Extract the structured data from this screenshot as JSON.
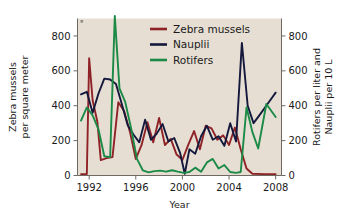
{
  "chart_data": {
    "type": "line",
    "title": "",
    "xlabel": "Year",
    "ylabel": "Zebra mussels per square meter",
    "ylabel_right": "Rotifers per liter and Nauplii per 10 L",
    "xlim": [
      1991,
      2008.5
    ],
    "ylim": [
      0,
      900
    ],
    "ylim_right": [
      0,
      900
    ],
    "grid": true,
    "legend_position": "top-center",
    "xticks": [
      1992,
      1996,
      2000,
      2004,
      2008
    ],
    "xtick_labels": [
      "1992",
      "1996",
      "2000",
      "2004",
      "2008"
    ],
    "yticks": [
      0,
      200,
      400,
      600,
      800
    ],
    "ytick_labels": [
      "0",
      "200",
      "400",
      "600",
      "800"
    ],
    "yticks_right": [
      0,
      200,
      400,
      600,
      800
    ],
    "ytick_labels_right": [
      "0",
      "200",
      "400",
      "600",
      "800"
    ],
    "plot_background": "#e6ded2",
    "series": [
      {
        "name": "Zebra mussels",
        "color": "#8e2226",
        "axis": "left",
        "x": [
          1991.3,
          1991.8,
          1992.0,
          1992.3,
          1992.7,
          1993.0,
          1993.5,
          1994.0,
          1994.5,
          1995.0,
          1995.5,
          1996.0,
          1996.5,
          1997.0,
          1997.5,
          1998.0,
          1998.5,
          1999.0,
          1999.5,
          2000.0,
          2000.5,
          2001.0,
          2001.5,
          2002.0,
          2002.5,
          2003.0,
          2003.5,
          2004.0,
          2004.5,
          2005.0,
          2005.5,
          2006.0,
          2007.0,
          2008.0
        ],
        "y": [
          8,
          8,
          672,
          430,
          310,
          88,
          100,
          105,
          420,
          370,
          250,
          95,
          175,
          305,
          190,
          330,
          175,
          210,
          120,
          90,
          175,
          255,
          150,
          285,
          270,
          205,
          230,
          175,
          275,
          150,
          40,
          10,
          8,
          8
        ]
      },
      {
        "name": "Nauplii",
        "color": "#14183c",
        "axis": "right",
        "x": [
          1991.3,
          1991.8,
          1992.3,
          1992.8,
          1993.3,
          1993.8,
          1994.3,
          1994.8,
          1995.3,
          1995.8,
          1996.3,
          1996.8,
          1997.3,
          1997.8,
          1998.3,
          1998.8,
          1999.3,
          1999.8,
          2000.2,
          2000.6,
          2001.1,
          2001.6,
          2002.1,
          2002.6,
          2003.1,
          2003.6,
          2004.1,
          2004.6,
          2005.1,
          2005.6,
          2006.1,
          2006.6,
          2007.3,
          2008.0
        ],
        "y": [
          465,
          480,
          360,
          470,
          555,
          550,
          525,
          410,
          290,
          235,
          190,
          320,
          205,
          240,
          295,
          195,
          215,
          130,
          10,
          150,
          125,
          225,
          285,
          205,
          225,
          170,
          300,
          195,
          760,
          400,
          300,
          345,
          410,
          475
        ]
      },
      {
        "name": "Rotifers",
        "color": "#1a8a46",
        "axis": "right",
        "x": [
          1991.3,
          1991.8,
          1992.3,
          1992.8,
          1993.3,
          1993.8,
          1994.2,
          1994.6,
          1995.1,
          1995.6,
          1996.1,
          1996.6,
          1997.1,
          1997.6,
          1998.1,
          1998.6,
          1999.1,
          1999.6,
          2000.1,
          2000.6,
          2001.1,
          2001.6,
          2002.1,
          2002.6,
          2003.1,
          2003.6,
          2004.1,
          2004.6,
          2005.0,
          2005.5,
          2006.0,
          2006.5,
          2007.2,
          2008.0
        ],
        "y": [
          315,
          390,
          345,
          265,
          110,
          105,
          915,
          500,
          420,
          270,
          95,
          30,
          18,
          25,
          28,
          22,
          30,
          22,
          15,
          20,
          45,
          22,
          75,
          95,
          40,
          60,
          20,
          15,
          20,
          390,
          250,
          155,
          410,
          335
        ]
      }
    ],
    "legend": [
      {
        "label": "Zebra mussels",
        "color": "#8e2226"
      },
      {
        "label": "Nauplii",
        "color": "#14183c"
      },
      {
        "label": "Rotifers",
        "color": "#1a8a46"
      }
    ]
  }
}
